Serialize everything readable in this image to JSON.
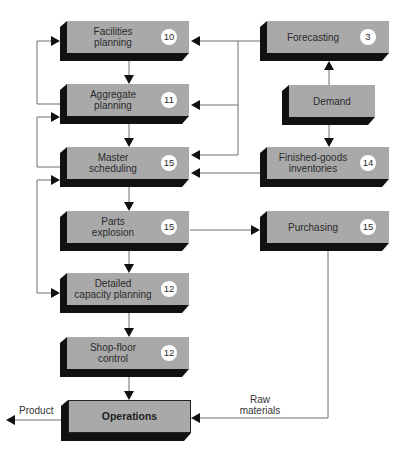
{
  "diagram": {
    "nodes": {
      "facilities": {
        "line1": "Facilities",
        "line2": "planning",
        "badge": "10"
      },
      "aggregate": {
        "line1": "Aggregate",
        "line2": "planning",
        "badge": "11"
      },
      "master": {
        "line1": "Master",
        "line2": "scheduling",
        "badge": "15"
      },
      "parts": {
        "line1": "Parts",
        "line2": "explosion",
        "badge": "15"
      },
      "detailed": {
        "line1": "Detailed",
        "line2": "capacity planning",
        "badge": "12"
      },
      "shopfloor": {
        "line1": "Shop-floor",
        "line2": "control",
        "badge": "12"
      },
      "operations": {
        "line1": "Operations"
      },
      "forecasting": {
        "line1": "Forecasting",
        "badge": "3"
      },
      "demand": {
        "line1": "Demand"
      },
      "finished": {
        "line1": "Finished-goods",
        "line2": "inventories",
        "badge": "14"
      },
      "purchasing": {
        "line1": "Purchasing",
        "badge": "15"
      }
    },
    "edge_labels": {
      "raw_line1": "Raw",
      "raw_line2": "materials",
      "product": "Product"
    },
    "edges": [
      [
        "Facilities planning",
        "Aggregate planning"
      ],
      [
        "Aggregate planning",
        "Facilities planning"
      ],
      [
        "Aggregate planning",
        "Master scheduling"
      ],
      [
        "Master scheduling",
        "Aggregate planning"
      ],
      [
        "Master scheduling",
        "Parts explosion"
      ],
      [
        "Master scheduling",
        "Detailed capacity planning"
      ],
      [
        "Detailed capacity planning",
        "Master scheduling"
      ],
      [
        "Parts explosion",
        "Detailed capacity planning"
      ],
      [
        "Parts explosion",
        "Purchasing"
      ],
      [
        "Detailed capacity planning",
        "Shop-floor control"
      ],
      [
        "Shop-floor control",
        "Operations"
      ],
      [
        "Forecasting",
        "Facilities planning"
      ],
      [
        "Forecasting",
        "Aggregate planning"
      ],
      [
        "Forecasting",
        "Master scheduling"
      ],
      [
        "Demand",
        "Forecasting"
      ],
      [
        "Demand",
        "Finished-goods inventories"
      ],
      [
        "Finished-goods inventories",
        "Master scheduling"
      ],
      [
        "Purchasing",
        "Operations"
      ],
      [
        "Operations",
        "Product"
      ]
    ],
    "colors": {
      "box_face": "#a9a9a9",
      "box_shadow": "#111111",
      "line": "#6e6e6e",
      "badge": "#ffffff"
    }
  }
}
